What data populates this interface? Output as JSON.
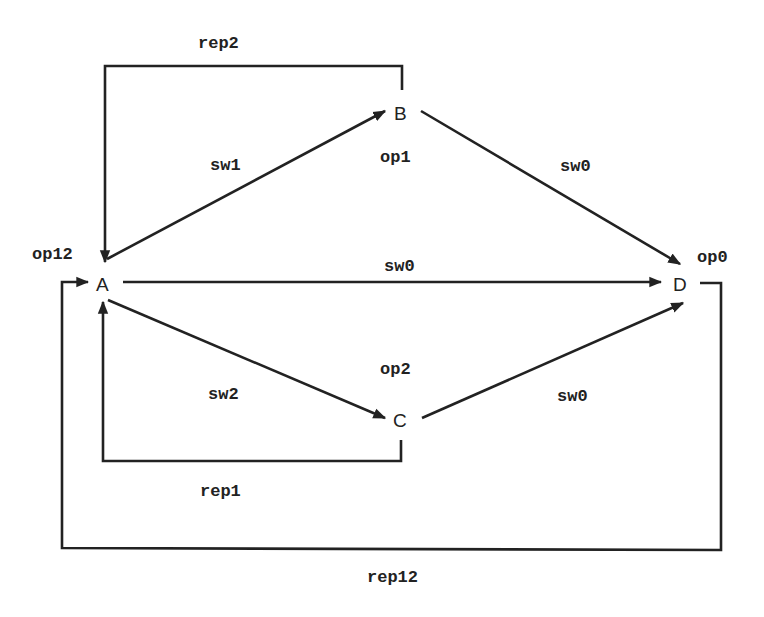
{
  "diagram": {
    "nodes": [
      {
        "id": "A",
        "label": "A",
        "x": 103,
        "y": 284
      },
      {
        "id": "B",
        "label": "B",
        "x": 401,
        "y": 113
      },
      {
        "id": "C",
        "label": "C",
        "x": 400,
        "y": 420
      },
      {
        "id": "D",
        "label": "D",
        "x": 680,
        "y": 284
      }
    ],
    "operations": {
      "op12": "op12",
      "op1": "op1",
      "op2": "op2",
      "op0": "op0"
    },
    "edges": [
      {
        "id": "A-B",
        "from": "A",
        "to": "B",
        "label": "sw1"
      },
      {
        "id": "A-D",
        "from": "A",
        "to": "D",
        "label": "sw0"
      },
      {
        "id": "A-C",
        "from": "A",
        "to": "C",
        "label": "sw2"
      },
      {
        "id": "B-D",
        "from": "B",
        "to": "D",
        "label": "sw0"
      },
      {
        "id": "C-D",
        "from": "C",
        "to": "D",
        "label": "sw0"
      },
      {
        "id": "B-A-rep",
        "from": "B",
        "to": "A",
        "label": "rep2"
      },
      {
        "id": "C-A-rep",
        "from": "C",
        "to": "A",
        "label": "rep1"
      },
      {
        "id": "D-A-rep",
        "from": "D",
        "to": "A",
        "label": "rep12"
      }
    ]
  }
}
